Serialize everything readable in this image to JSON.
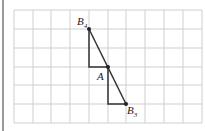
{
  "diagram": {
    "grid": {
      "cols": 10,
      "rows": 6,
      "x0": 14,
      "y0": 10,
      "cell": 18.8,
      "line_color": "#c8c8c8"
    },
    "points": [
      {
        "label": "B",
        "sub": "4",
        "col": 4,
        "row": 1
      },
      {
        "label": "A",
        "sub": "",
        "col": 5,
        "row": 3
      },
      {
        "label": "B",
        "sub": "3",
        "col": 6,
        "row": 5
      }
    ],
    "labels": {
      "b4": "B",
      "b4_sub": "4",
      "a": "A",
      "b3": "B",
      "b3_sub": "3"
    }
  }
}
